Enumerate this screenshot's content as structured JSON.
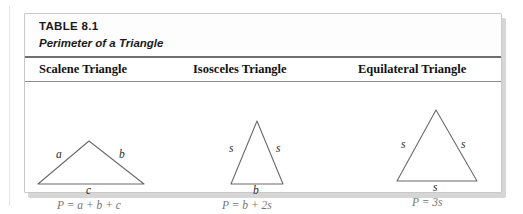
{
  "figure": {
    "caption": {
      "table_number": "TABLE 8.1",
      "title": "Perimeter of a Triangle"
    },
    "columns": [
      {
        "id": "scalene",
        "header": "Scalene Triangle",
        "shape": "scalene-triangle",
        "side_labels": [
          "a",
          "b",
          "c"
        ],
        "formula": "P = a + b + c"
      },
      {
        "id": "isosceles",
        "header": "Isosceles Triangle",
        "shape": "isosceles-triangle",
        "side_labels": [
          "s",
          "s",
          "b"
        ],
        "formula": "P = b + 2s"
      },
      {
        "id": "equilateral",
        "header": "Equilateral Triangle",
        "shape": "equilateral-triangle",
        "side_labels": [
          "s",
          "s",
          "s"
        ],
        "formula": "P = 3s"
      }
    ],
    "colors": {
      "stroke": "#6b6b6b",
      "rule": "#6f6f6f",
      "border": "#c9c9c9",
      "text": "#1a1a1a",
      "formula_text": "#555555",
      "page_background": "#ffffff"
    }
  }
}
